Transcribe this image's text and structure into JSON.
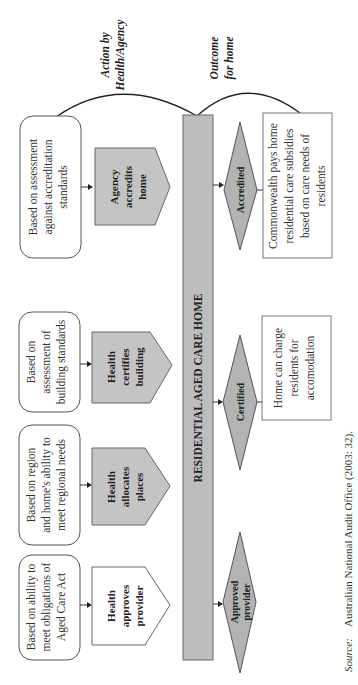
{
  "headers": {
    "action": [
      "Action by",
      "Health/Agency"
    ],
    "outcome": [
      "Outcome",
      "for home"
    ]
  },
  "central_bar": {
    "label": "RESIDENTIAL AGED CARE HOME"
  },
  "criteria": [
    {
      "lines": [
        "Based on ability to",
        "meet obligations of",
        "Aged Care Act"
      ]
    },
    {
      "lines": [
        "Based on region",
        "and home's ability to",
        "meet regional needs"
      ]
    },
    {
      "lines": [
        "Based on",
        "assessment of",
        "building standards"
      ]
    },
    {
      "lines": [
        "Based on assessment",
        "against accreditation",
        "standards"
      ]
    }
  ],
  "actions": [
    {
      "lines": [
        "Health",
        "approves",
        "provider"
      ],
      "shaded": false
    },
    {
      "lines": [
        "Health",
        "allocates",
        "places"
      ],
      "shaded": true
    },
    {
      "lines": [
        "Health",
        "certifies",
        "building"
      ],
      "shaded": true
    },
    {
      "lines": [
        "Agency",
        "accredits",
        "home"
      ],
      "shaded": true
    }
  ],
  "outcomes": [
    {
      "lines": [
        "Approved",
        "provider"
      ]
    },
    {
      "lines": [
        "Certified"
      ]
    },
    {
      "lines": [
        "Accredited"
      ]
    }
  ],
  "results": [
    {
      "lines": [
        "Home can charge",
        "residents for",
        "accomodation"
      ]
    },
    {
      "lines": [
        "Commonwealth pays home",
        "residential care subsidies",
        "based on care needs of",
        "residents"
      ]
    }
  ],
  "source": {
    "label": "Source:",
    "text": "Australian National Audit Office (2003: 32)."
  },
  "colors": {
    "bar_fill": "#bdbdbd",
    "shape_fill": "#c4c4c4",
    "diamond_fill": "#b3b3b3",
    "stroke": "#555555"
  }
}
